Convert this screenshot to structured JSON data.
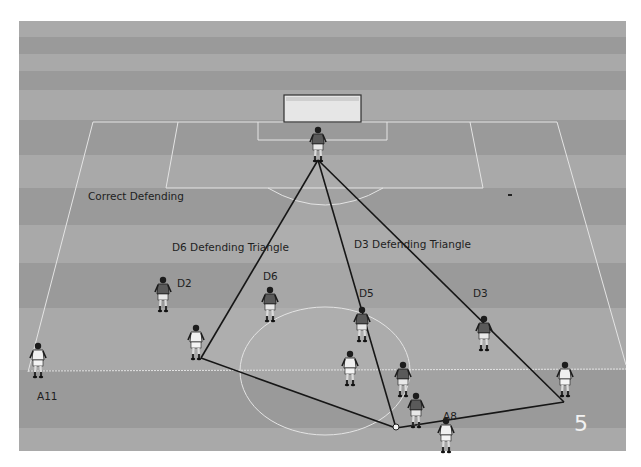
{
  "diagram": {
    "title": "Correct Defending",
    "slide_number": "5",
    "colors": {
      "stripe_light": "#a9a9a9",
      "stripe_dark": "#9a9a9a",
      "pitch_line": "#e4e4e4",
      "triangle_fill": "#b4b4b4",
      "triangle_line": "#161616",
      "defender_shirt": "#5a5a5a",
      "attacker_shirt": "#f0f0f0"
    },
    "stripes": [
      {
        "y": 21,
        "h": 16,
        "shade": "light"
      },
      {
        "y": 37,
        "h": 17,
        "shade": "dark"
      },
      {
        "y": 54,
        "h": 17,
        "shade": "light"
      },
      {
        "y": 71,
        "h": 19,
        "shade": "dark"
      },
      {
        "y": 90,
        "h": 30,
        "shade": "light"
      },
      {
        "y": 120,
        "h": 35,
        "shade": "dark"
      },
      {
        "y": 155,
        "h": 33,
        "shade": "light"
      },
      {
        "y": 188,
        "h": 37,
        "shade": "dark"
      },
      {
        "y": 225,
        "h": 38,
        "shade": "light"
      },
      {
        "y": 263,
        "h": 45,
        "shade": "dark"
      },
      {
        "y": 308,
        "h": 62,
        "shade": "light"
      },
      {
        "y": 370,
        "h": 58,
        "shade": "dark"
      },
      {
        "y": 428,
        "h": 23,
        "shade": "light"
      }
    ],
    "annotations": {
      "d6_triangle": "D6 Defending Triangle",
      "d3_triangle": "D3 Defending Triangle"
    },
    "players": [
      {
        "id": "GK",
        "label": "",
        "team": "defender",
        "x": 318,
        "y": 127
      },
      {
        "id": "D2",
        "label": "D2",
        "team": "defender",
        "x": 163,
        "y": 277
      },
      {
        "id": "D6",
        "label": "D6",
        "team": "defender",
        "x": 270,
        "y": 287
      },
      {
        "id": "D5",
        "label": "D5",
        "team": "defender",
        "x": 362,
        "y": 307
      },
      {
        "id": "D3",
        "label": "D3",
        "team": "defender",
        "x": 484,
        "y": 316
      },
      {
        "id": "D4",
        "label": "",
        "team": "defender",
        "x": 403,
        "y": 362
      },
      {
        "id": "D8",
        "label": "",
        "team": "defender",
        "x": 416,
        "y": 393
      },
      {
        "id": "A11",
        "label": "A11",
        "team": "attacker",
        "x": 38,
        "y": 343
      },
      {
        "id": "A7",
        "label": "",
        "team": "attacker",
        "x": 196,
        "y": 325
      },
      {
        "id": "A9",
        "label": "",
        "team": "attacker",
        "x": 350,
        "y": 351
      },
      {
        "id": "A10",
        "label": "",
        "team": "attacker",
        "x": 565,
        "y": 362
      },
      {
        "id": "A8",
        "label": "A8",
        "team": "attacker",
        "x": 446,
        "y": 418
      }
    ],
    "triangle_vertices": {
      "apex": [
        318,
        160
      ],
      "left": [
        201,
        358
      ],
      "ball": [
        396,
        428
      ],
      "right": [
        564,
        402
      ]
    }
  }
}
